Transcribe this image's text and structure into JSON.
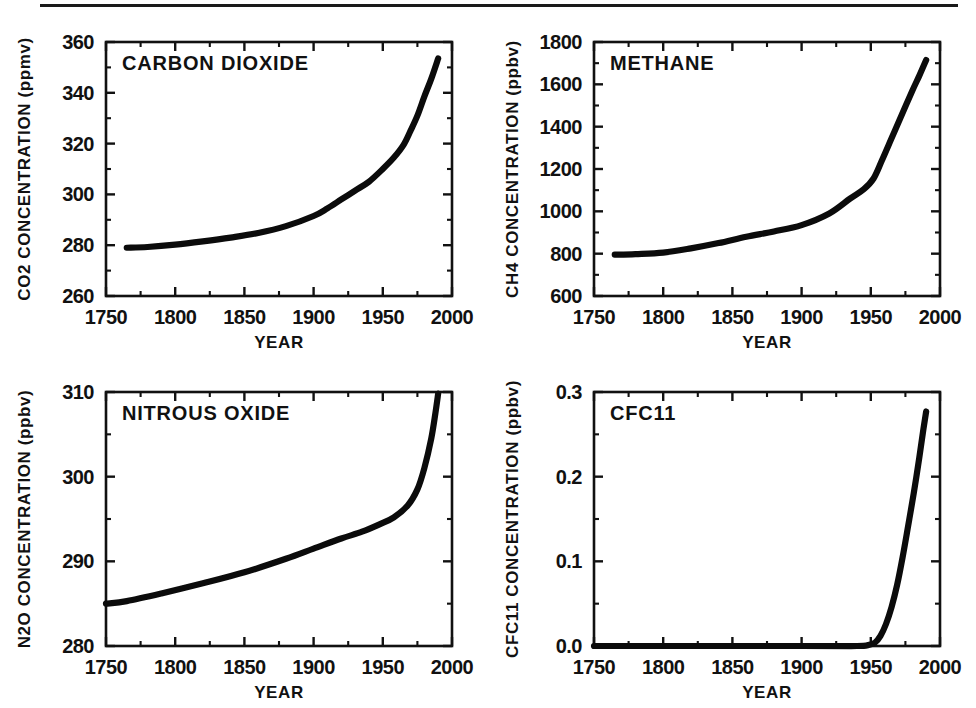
{
  "figure": {
    "has_top_rule": true,
    "background_color": "#ffffff",
    "line_color": "#0b0b0b",
    "axis_color": "#111111"
  },
  "chart_data": [
    {
      "id": "co2",
      "type": "line",
      "title": "CARBON  DIOXIDE",
      "xlabel": "YEAR",
      "ylabel": "CO2  CONCENTRATION  (ppmv)",
      "xlim": [
        1750,
        2000
      ],
      "ylim": [
        260,
        360
      ],
      "xticks": [
        1750,
        1800,
        1850,
        1900,
        1950,
        2000
      ],
      "xticklabels": [
        "1750",
        "1800",
        "1850",
        "1900",
        "1950",
        "2000"
      ],
      "yticks": [
        260,
        280,
        300,
        320,
        340,
        360
      ],
      "yticklabels": [
        "260",
        "280",
        "300",
        "320",
        "340",
        "360"
      ],
      "xminor_step": 25,
      "yminor_step": 10,
      "grid": false,
      "legend": "none",
      "x": [
        1765,
        1780,
        1800,
        1820,
        1840,
        1860,
        1880,
        1900,
        1910,
        1920,
        1930,
        1940,
        1950,
        1958,
        1965,
        1970,
        1975,
        1980,
        1985,
        1990
      ],
      "values": [
        279.0,
        279.3,
        280.2,
        281.5,
        283.0,
        284.8,
        287.5,
        291.5,
        294.5,
        298.0,
        301.5,
        305.0,
        310.0,
        314.5,
        319.5,
        325.0,
        331.0,
        338.5,
        345.5,
        353.5
      ]
    },
    {
      "id": "ch4",
      "type": "line",
      "title": "METHANE",
      "xlabel": "YEAR",
      "ylabel": "CH4  CONCENTRATION  (ppbv)",
      "xlim": [
        1750,
        2000
      ],
      "ylim": [
        600,
        1800
      ],
      "xticks": [
        1750,
        1800,
        1850,
        1900,
        1950,
        2000
      ],
      "xticklabels": [
        "1750",
        "1800",
        "1850",
        "1900",
        "1950",
        "2000"
      ],
      "yticks": [
        600,
        800,
        1000,
        1200,
        1400,
        1600,
        1800
      ],
      "yticklabels": [
        "600",
        "800",
        "1000",
        "1200",
        "1400",
        "1600",
        "1800"
      ],
      "xminor_step": 25,
      "yminor_step": 100,
      "grid": false,
      "legend": "none",
      "x": [
        1765,
        1780,
        1800,
        1820,
        1840,
        1860,
        1880,
        1900,
        1920,
        1935,
        1945,
        1952,
        1958,
        1965,
        1972,
        1980,
        1985,
        1990
      ],
      "values": [
        795,
        798,
        805,
        825,
        850,
        880,
        905,
        935,
        990,
        1060,
        1105,
        1155,
        1240,
        1345,
        1450,
        1570,
        1640,
        1715
      ]
    },
    {
      "id": "n2o",
      "type": "line",
      "title": "NITROUS  OXIDE",
      "xlabel": "YEAR",
      "ylabel": "N2O  CONCENTRATION  (ppbv)",
      "xlim": [
        1750,
        2000
      ],
      "ylim": [
        280,
        310
      ],
      "xticks": [
        1750,
        1800,
        1850,
        1900,
        1950,
        2000
      ],
      "xticklabels": [
        "1750",
        "1800",
        "1850",
        "1900",
        "1950",
        "2000"
      ],
      "yticks": [
        280,
        290,
        300,
        310
      ],
      "yticklabels": [
        "280",
        "290",
        "300",
        "310"
      ],
      "xminor_step": 25,
      "yminor_step": 5,
      "grid": false,
      "legend": "none",
      "x": [
        1750,
        1765,
        1790,
        1820,
        1850,
        1880,
        1900,
        1920,
        1935,
        1948,
        1958,
        1968,
        1975,
        1980,
        1985,
        1988,
        1990
      ],
      "values": [
        285.0,
        285.3,
        286.2,
        287.4,
        288.7,
        290.3,
        291.5,
        292.7,
        293.5,
        294.4,
        295.2,
        296.6,
        298.5,
        301.0,
        304.5,
        307.5,
        309.8
      ]
    },
    {
      "id": "cfc11",
      "type": "line",
      "title": "CFC11",
      "xlabel": "YEAR",
      "ylabel": "CFC11  CONCENTRATION  (ppbv)",
      "xlim": [
        1750,
        2000
      ],
      "ylim": [
        0.0,
        0.3
      ],
      "xticks": [
        1750,
        1800,
        1850,
        1900,
        1950,
        2000
      ],
      "xticklabels": [
        "1750",
        "1800",
        "1850",
        "1900",
        "1950",
        "2000"
      ],
      "yticks": [
        0.0,
        0.1,
        0.2,
        0.3
      ],
      "yticklabels": [
        "0.0",
        "0.1",
        "0.2",
        "0.3"
      ],
      "xminor_step": 25,
      "yminor_step": 0.05,
      "grid": false,
      "legend": "none",
      "x": [
        1750,
        1900,
        1940,
        1948,
        1953,
        1957,
        1961,
        1965,
        1969,
        1973,
        1977,
        1981,
        1985,
        1988,
        1990
      ],
      "values": [
        0.0,
        0.0,
        0.0,
        0.001,
        0.004,
        0.012,
        0.026,
        0.046,
        0.072,
        0.105,
        0.142,
        0.18,
        0.222,
        0.256,
        0.277
      ]
    }
  ]
}
